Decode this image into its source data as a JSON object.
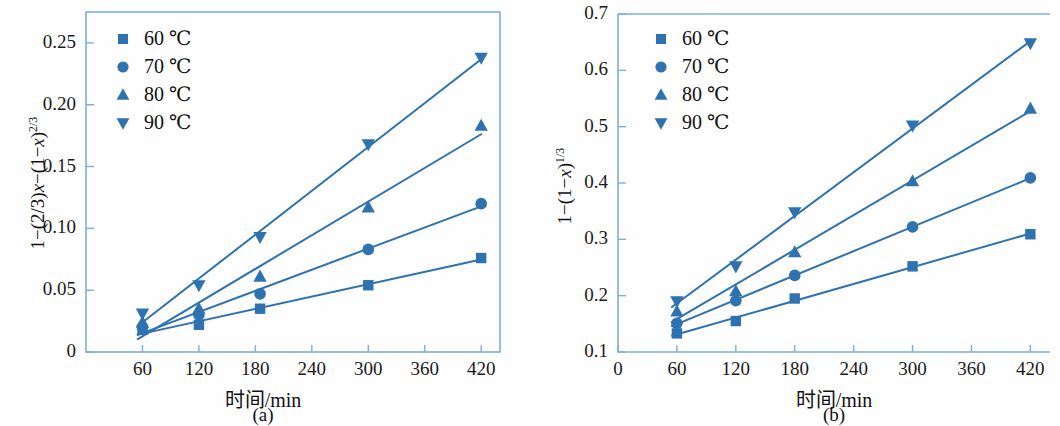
{
  "figure": {
    "accent_color": "#2E72B0",
    "axis_color": "#7FAFD6",
    "background": "#ffffff"
  },
  "legend": {
    "items": [
      {
        "label": "60 ℃",
        "marker": "square-marker"
      },
      {
        "label": "70 ℃",
        "marker": "circle-marker"
      },
      {
        "label": "80 ℃",
        "marker": "triangle-up-marker"
      },
      {
        "label": "90 ℃",
        "marker": "triangle-down-marker"
      }
    ]
  },
  "panel_a": {
    "caption": "(a)",
    "xlabel": "时间/min",
    "ylabel_html": "1−(2/3)<i>x</i>−(1−<i>x</i>)<sup>2/3</sup>",
    "xticklabels": [
      "60",
      "120",
      "180",
      "240",
      "300",
      "360",
      "420"
    ],
    "yticklabels": [
      "0",
      "0.05",
      "0.10",
      "0.15",
      "0.20",
      "0.25"
    ]
  },
  "panel_b": {
    "caption": "(b)",
    "xlabel": "时间/min",
    "ylabel_html": "1−(1−<i>x</i>)<sup>1/3</sup>",
    "xticklabels": [
      "0",
      "60",
      "120",
      "180",
      "240",
      "300",
      "360",
      "420"
    ],
    "yticklabels": [
      "0.1",
      "0.2",
      "0.3",
      "0.4",
      "0.5",
      "0.6",
      "0.7"
    ]
  },
  "chart_data": [
    {
      "type": "scatter",
      "panel": "(a)",
      "title": "",
      "xlabel": "时间/min",
      "ylabel": "1-(2/3)x-(1-x)^(2/3)",
      "xlim": [
        0,
        440
      ],
      "ylim": [
        0,
        0.275
      ],
      "xticks": [
        60,
        120,
        180,
        240,
        300,
        360,
        420
      ],
      "yticks": [
        0,
        0.05,
        0.1,
        0.15,
        0.2,
        0.25
      ],
      "grid": false,
      "legend_position": "top-left",
      "series": [
        {
          "name": "60 ℃",
          "marker": "square",
          "x": [
            60,
            120,
            185,
            300,
            420
          ],
          "values": [
            0.018,
            0.022,
            0.035,
            0.054,
            0.076
          ]
        },
        {
          "name": "70 ℃",
          "marker": "circle",
          "x": [
            60,
            120,
            185,
            300,
            420
          ],
          "values": [
            0.02,
            0.03,
            0.047,
            0.083,
            0.12
          ]
        },
        {
          "name": "80 ℃",
          "marker": "triangle-up",
          "x": [
            60,
            120,
            185,
            300,
            420
          ],
          "values": [
            0.024,
            0.035,
            0.061,
            0.117,
            0.183
          ]
        },
        {
          "name": "90 ℃",
          "marker": "triangle-down",
          "x": [
            60,
            120,
            185,
            300,
            420
          ],
          "values": [
            0.031,
            0.054,
            0.093,
            0.168,
            0.238
          ]
        }
      ]
    },
    {
      "type": "scatter",
      "panel": "(b)",
      "title": "",
      "xlabel": "时间/min",
      "ylabel": "1-(1-x)^(1/3)",
      "xlim": [
        0,
        440
      ],
      "ylim": [
        0.1,
        0.7
      ],
      "xticks": [
        0,
        60,
        120,
        180,
        240,
        300,
        360,
        420
      ],
      "yticks": [
        0.1,
        0.2,
        0.3,
        0.4,
        0.5,
        0.6,
        0.7
      ],
      "grid": false,
      "legend_position": "top-left",
      "series": [
        {
          "name": "60 ℃",
          "marker": "square",
          "x": [
            60,
            120,
            180,
            300,
            420
          ],
          "values": [
            0.133,
            0.155,
            0.195,
            0.252,
            0.309
          ]
        },
        {
          "name": "70 ℃",
          "marker": "circle",
          "x": [
            60,
            120,
            180,
            300,
            420
          ],
          "values": [
            0.151,
            0.191,
            0.236,
            0.322,
            0.409
          ]
        },
        {
          "name": "80 ℃",
          "marker": "triangle-up",
          "x": [
            60,
            120,
            180,
            300,
            420
          ],
          "values": [
            0.172,
            0.208,
            0.277,
            0.403,
            0.532
          ]
        },
        {
          "name": "90 ℃",
          "marker": "triangle-down",
          "x": [
            60,
            120,
            180,
            300,
            420
          ],
          "values": [
            0.19,
            0.252,
            0.348,
            0.502,
            0.648
          ]
        }
      ]
    }
  ]
}
